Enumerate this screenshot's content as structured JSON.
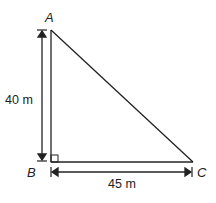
{
  "diagram": {
    "type": "right-triangle",
    "vertices": {
      "A": {
        "label": "A"
      },
      "B": {
        "label": "B"
      },
      "C": {
        "label": "C"
      }
    },
    "right_angle_at": "B",
    "dimensions": {
      "vertical": {
        "label": "40 m",
        "from": "A",
        "to": "B"
      },
      "horizontal": {
        "label": "45 m",
        "from": "B",
        "to": "C"
      }
    },
    "colors": {
      "stroke": "#222222",
      "background": "#ffffff"
    }
  }
}
